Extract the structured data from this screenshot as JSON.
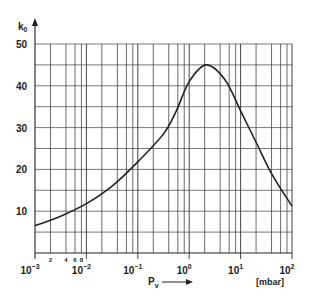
{
  "chart_data": {
    "type": "line",
    "title": "",
    "xlabel": "P_v",
    "xunit": "[mbar]",
    "ylabel": "k_0",
    "xscale": "log",
    "xlim": [
      0.001,
      100
    ],
    "ylim": [
      0,
      50
    ],
    "grid": true,
    "legend": null,
    "y_ticks": [
      10,
      20,
      30,
      40,
      50
    ],
    "x_ticks": [
      "10^-3",
      "10^-2",
      "10^-1",
      "10^0",
      "10^1",
      "10^2"
    ],
    "x_minor_labels": [
      "2",
      "4",
      "6",
      "8"
    ],
    "series": [
      {
        "name": "k0 vs Pv",
        "x": [
          0.001,
          0.00316,
          0.01,
          0.0316,
          0.1,
          0.316,
          0.562,
          1.0,
          2.14,
          5.0,
          10.0,
          20.0,
          40.0,
          100.0
        ],
        "y": [
          6.5,
          8.8,
          11.8,
          16.0,
          21.8,
          28.5,
          34.0,
          41.0,
          45.0,
          41.4,
          34.0,
          26.5,
          19.0,
          11.2
        ]
      }
    ]
  },
  "labels": {
    "y_axis": "k",
    "y_axis_sub": "0",
    "x_axis": "P",
    "x_axis_sub": "v",
    "unit": "[mbar]",
    "y_ticks": [
      "10",
      "20",
      "30",
      "40",
      "50"
    ],
    "x_minor": [
      "2",
      "4",
      "6",
      "8"
    ],
    "x_decades": [
      {
        "base": "10",
        "exp": "−3"
      },
      {
        "base": "10",
        "exp": "−2"
      },
      {
        "base": "10",
        "exp": "−1"
      },
      {
        "base": "10",
        "exp": "0"
      },
      {
        "base": "10",
        "exp": "1"
      },
      {
        "base": "10",
        "exp": "2"
      }
    ]
  }
}
